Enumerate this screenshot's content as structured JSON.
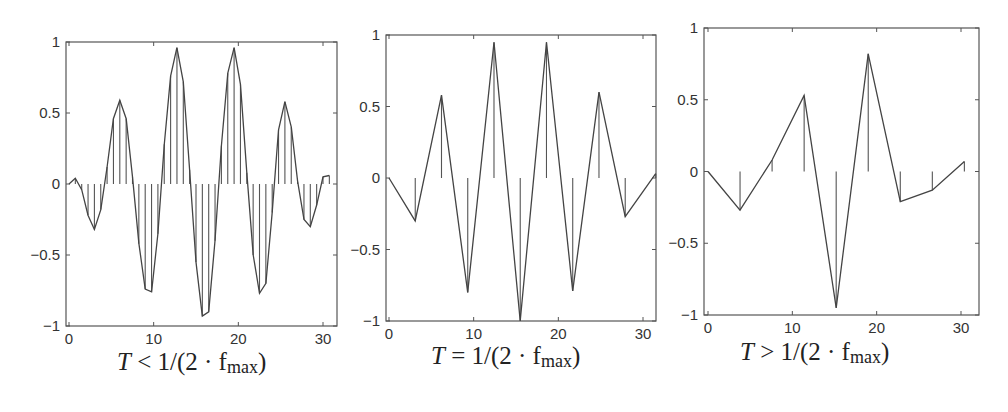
{
  "figure": {
    "panels": [
      {
        "caption_T": "T",
        "caption_rel": "<",
        "caption_rest": "1/(2 · f",
        "caption_sub": "max",
        "caption_end": ")"
      },
      {
        "caption_T": "T",
        "caption_rel": "=",
        "caption_rest": "1/(2 · f",
        "caption_sub": "max",
        "caption_end": ")"
      },
      {
        "caption_T": "T",
        "caption_rel": ">",
        "caption_rest": "1/(2 · f",
        "caption_sub": "max",
        "caption_end": ")"
      }
    ]
  },
  "chart_data": [
    {
      "type": "line",
      "subtype": "stem+line",
      "title": "T < 1/(2·f_max)",
      "xlabel": "",
      "ylabel": "",
      "xlim": [
        0,
        32
      ],
      "ylim": [
        -1,
        1
      ],
      "xticks": [
        0,
        10,
        20,
        30
      ],
      "yticks": [
        -1,
        -0.5,
        0,
        0.5,
        1
      ],
      "ytick_labels": [
        "-1",
        "-0.5",
        "0",
        "0.5",
        "1"
      ],
      "xtick_labels": [
        "0",
        "10",
        "20",
        "30"
      ],
      "grid": false,
      "x": [
        0,
        0.75,
        1.5,
        2.25,
        3.0,
        3.75,
        4.5,
        5.25,
        6.0,
        6.75,
        7.5,
        8.25,
        9.0,
        9.75,
        10.5,
        11.25,
        12.0,
        12.75,
        13.5,
        14.25,
        15.0,
        15.75,
        16.5,
        17.25,
        18.0,
        18.75,
        19.5,
        20.25,
        21.0,
        21.75,
        22.5,
        23.25,
        24.0,
        24.75,
        25.5,
        26.25,
        27.0,
        27.75,
        28.5,
        29.25,
        30.0,
        30.75
      ],
      "values": [
        0.0,
        0.04,
        -0.04,
        -0.22,
        -0.32,
        -0.18,
        0.12,
        0.46,
        0.59,
        0.46,
        0.05,
        -0.42,
        -0.74,
        -0.76,
        -0.35,
        0.28,
        0.76,
        0.96,
        0.72,
        0.1,
        -0.55,
        -0.93,
        -0.9,
        -0.4,
        0.27,
        0.78,
        0.96,
        0.7,
        0.08,
        -0.5,
        -0.77,
        -0.7,
        -0.2,
        0.38,
        0.58,
        0.4,
        0.02,
        -0.25,
        -0.3,
        -0.15,
        0.05,
        0.06
      ]
    },
    {
      "type": "line",
      "subtype": "stem+line",
      "title": "T = 1/(2·f_max)",
      "xlabel": "",
      "ylabel": "",
      "xlim": [
        0,
        32
      ],
      "ylim": [
        -1,
        1
      ],
      "xticks": [
        0,
        10,
        20,
        30
      ],
      "yticks": [
        -1,
        -0.5,
        0,
        0.5,
        1
      ],
      "ytick_labels": [
        "-1",
        "-0.5",
        "0",
        "0.5",
        "1"
      ],
      "xtick_labels": [
        "0",
        "10",
        "20",
        "30"
      ],
      "grid": false,
      "x": [
        0,
        3.1,
        6.2,
        9.3,
        12.4,
        15.5,
        18.6,
        21.7,
        24.8,
        27.9,
        31.5
      ],
      "values": [
        0.0,
        -0.3,
        0.58,
        -0.8,
        0.95,
        -1.0,
        0.95,
        -0.79,
        0.6,
        -0.27,
        0.03
      ]
    },
    {
      "type": "line",
      "subtype": "stem+line",
      "title": "T > 1/(2·f_max)",
      "xlabel": "",
      "ylabel": "",
      "xlim": [
        0,
        32
      ],
      "ylim": [
        -1,
        1
      ],
      "xticks": [
        0,
        10,
        20,
        30
      ],
      "yticks": [
        -1,
        -0.5,
        0,
        0.5,
        1
      ],
      "ytick_labels": [
        "-1",
        "-0.5",
        "0",
        "0.5",
        "1"
      ],
      "xtick_labels": [
        "0",
        "10",
        "20",
        "30"
      ],
      "grid": false,
      "x": [
        0,
        3.8,
        7.6,
        11.4,
        15.2,
        19.0,
        22.8,
        26.6,
        30.4
      ],
      "values": [
        0.0,
        -0.27,
        0.08,
        0.53,
        -0.95,
        0.82,
        -0.21,
        -0.13,
        0.07
      ]
    }
  ]
}
